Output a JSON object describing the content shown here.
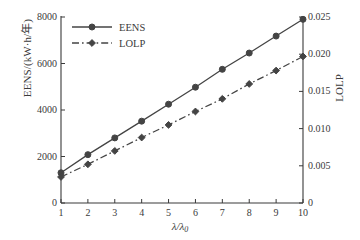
{
  "chart_data": {
    "type": "line",
    "title": "",
    "xlabel": "λ/λ₀",
    "ylabel": "EENS/(kW·h/年)",
    "y2label": "LOLP",
    "x": [
      1,
      2,
      3,
      4,
      5,
      6,
      7,
      8,
      9,
      10
    ],
    "xlim": [
      1,
      10
    ],
    "ylim": [
      0,
      8000
    ],
    "y2lim": [
      0,
      0.025
    ],
    "xticks": [
      "1",
      "2",
      "3",
      "4",
      "5",
      "6",
      "7",
      "8",
      "9",
      "10"
    ],
    "yticks": [
      "0",
      "2000",
      "4000",
      "6000",
      "8000"
    ],
    "y2ticks": [
      "0",
      "0.005",
      "0.010",
      "0.015",
      "0.020",
      "0.025"
    ],
    "ytick_values": [
      0,
      2000,
      4000,
      6000,
      8000
    ],
    "y2tick_values": [
      0,
      0.005,
      0.01,
      0.015,
      0.02,
      0.025
    ],
    "grid": false,
    "legend_position": "top-left",
    "series": [
      {
        "name": "EENS",
        "axis": "left",
        "line_style": "solid",
        "marker": "circle",
        "color": "#444444",
        "values": [
          1300,
          2080,
          2800,
          3520,
          4250,
          4980,
          5750,
          6450,
          7180,
          7900
        ]
      },
      {
        "name": "LOLP",
        "axis": "right",
        "line_style": "dashdot",
        "marker": "diamond",
        "color": "#444444",
        "values": [
          0.0035,
          0.0052,
          0.007,
          0.0088,
          0.0105,
          0.0123,
          0.014,
          0.016,
          0.0178,
          0.0197
        ]
      }
    ]
  },
  "legend": {
    "items": [
      {
        "label": "EENS"
      },
      {
        "label": "LOLP"
      }
    ]
  },
  "axes": {
    "left_title": "EENS/(kW·h/年)",
    "right_title": "LOLP",
    "x_title_main": "λ/λ",
    "x_title_sub": "0"
  },
  "colors": {
    "line": "#444444",
    "axis": "#3a3a3a",
    "background": "#ffffff"
  }
}
